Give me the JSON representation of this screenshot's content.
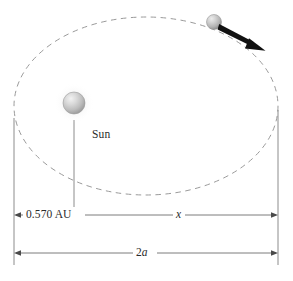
{
  "figure": {
    "type": "orbital-diagram",
    "background_color": "#ffffff",
    "orbit": {
      "name": "elliptical-orbit",
      "style": "dashed",
      "color": "#9a9a9a",
      "center_x": 146,
      "center_y": 106,
      "rx": 132,
      "ry": 89
    },
    "sun": {
      "label": "Sun",
      "color": "#b9b9b9",
      "cx": 74,
      "cy": 103,
      "r": 11
    },
    "planet": {
      "color": "#b0b0b0",
      "cx": 214,
      "cy": 22,
      "r": 7.5
    },
    "velocity_arrow": {
      "color": "#111111",
      "x1": 219,
      "y1": 27,
      "x2": 263,
      "y2": 50
    },
    "dimensions": [
      {
        "name": "perihelion-distance",
        "label": "0.570 AU",
        "from_x": 14,
        "to_x": 74,
        "y": 215
      },
      {
        "name": "remaining-distance",
        "label": "x",
        "italic": true,
        "from_x": 74,
        "to_x": 278,
        "y": 215
      },
      {
        "name": "major-axis",
        "label": "2a",
        "label_prefix": "2",
        "label_italic": "a",
        "from_x": 14,
        "to_x": 278,
        "y": 253
      }
    ],
    "guide_lines": [
      {
        "name": "guide-line-left",
        "x": 14,
        "y1": 118,
        "y2": 265
      },
      {
        "name": "guide-line-sun",
        "x": 74,
        "y1": 120,
        "y2": 218
      },
      {
        "name": "guide-line-right",
        "x": 278,
        "y1": 110,
        "y2": 265
      }
    ]
  }
}
